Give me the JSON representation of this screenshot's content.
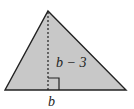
{
  "diagram": {
    "shape": "triangle",
    "fill_color": "#c8c8c8",
    "stroke_color": "#222222",
    "labels": {
      "height": "b − 3",
      "base": "b"
    },
    "elements": [
      "triangle",
      "dashed-altitude",
      "right-angle-marker"
    ]
  }
}
